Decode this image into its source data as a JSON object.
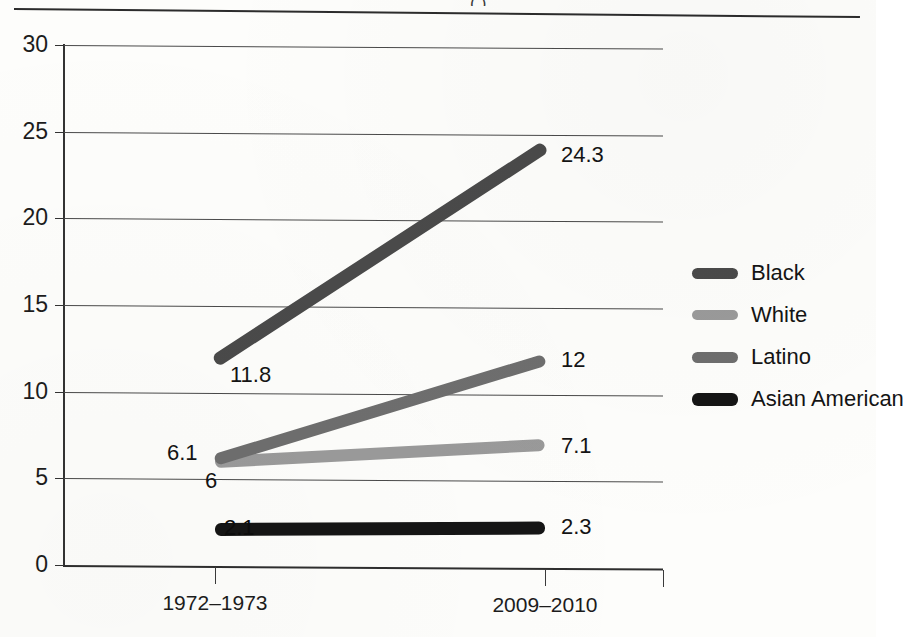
{
  "page": {
    "background_color": "#fdfdfb",
    "top_rule_color": "#2c2c2c",
    "partial_title_fragment": "( )"
  },
  "chart_data": {
    "type": "line",
    "title": "",
    "xlabel": "",
    "ylabel": "",
    "categories": [
      "1972–1973",
      "2009–2010"
    ],
    "ylim": [
      0,
      30
    ],
    "yticks": [
      0,
      5,
      10,
      15,
      20,
      25,
      30
    ],
    "grid": true,
    "legend_position": "right",
    "series": [
      {
        "name": "Black",
        "color": "#4a4a4a",
        "values": [
          11.8,
          24.3
        ],
        "labels": [
          "11.8",
          "24.3"
        ]
      },
      {
        "name": "White",
        "color": "#9a9a9a",
        "values": [
          6,
          7.1
        ],
        "labels": [
          "6",
          "7.1"
        ]
      },
      {
        "name": "Latino",
        "color": "#6e6e6e",
        "values": [
          6.1,
          12
        ],
        "labels": [
          "6.1",
          "12"
        ]
      },
      {
        "name": "Asian American",
        "color": "#151515",
        "values": [
          2.1,
          2.3
        ],
        "labels": [
          "2.1",
          "2.3"
        ]
      }
    ]
  },
  "axis": {
    "y_tick_labels": [
      "30",
      "25",
      "20",
      "15",
      "10",
      "5",
      "0"
    ],
    "x_tick_labels": [
      "1972–1973",
      "2009–2010"
    ]
  },
  "legend": {
    "items": [
      {
        "label": "Black",
        "color": "#4a4a4a"
      },
      {
        "label": "White",
        "color": "#9a9a9a"
      },
      {
        "label": "Latino",
        "color": "#6e6e6e"
      },
      {
        "label": "Asian American",
        "color": "#151515"
      }
    ]
  }
}
